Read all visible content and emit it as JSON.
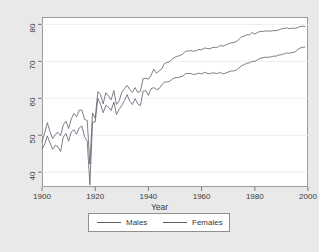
{
  "chart_data": {
    "type": "line",
    "title": "",
    "xlabel": "Year",
    "ylabel": "",
    "xlim": [
      1900,
      2000
    ],
    "ylim": [
      36,
      82
    ],
    "grid": true,
    "legend_position": "below-plot",
    "xticks": [
      1900,
      1920,
      1940,
      1960,
      1980,
      2000
    ],
    "yticks": [
      40,
      50,
      60,
      70,
      80
    ],
    "x": [
      1900,
      1901,
      1902,
      1903,
      1904,
      1905,
      1906,
      1907,
      1908,
      1909,
      1910,
      1911,
      1912,
      1913,
      1914,
      1915,
      1916,
      1917,
      1918,
      1919,
      1920,
      1921,
      1922,
      1923,
      1924,
      1925,
      1926,
      1927,
      1928,
      1929,
      1930,
      1931,
      1932,
      1933,
      1934,
      1935,
      1936,
      1937,
      1938,
      1939,
      1940,
      1941,
      1942,
      1943,
      1944,
      1945,
      1946,
      1947,
      1948,
      1949,
      1950,
      1951,
      1952,
      1953,
      1954,
      1955,
      1956,
      1957,
      1958,
      1959,
      1960,
      1961,
      1962,
      1963,
      1964,
      1965,
      1966,
      1967,
      1968,
      1969,
      1970,
      1971,
      1972,
      1973,
      1974,
      1975,
      1976,
      1977,
      1978,
      1979,
      1980,
      1981,
      1982,
      1983,
      1984,
      1985,
      1986,
      1987,
      1988,
      1989,
      1990,
      1991,
      1992,
      1993,
      1994,
      1995,
      1996,
      1997,
      1998,
      1999
    ],
    "series": [
      {
        "name": "Males",
        "color": "#5d5d6b",
        "values": [
          46.3,
          47.6,
          49.8,
          48.0,
          46.2,
          47.3,
          46.9,
          45.6,
          49.5,
          50.5,
          48.4,
          50.9,
          51.5,
          50.3,
          52.0,
          52.5,
          49.6,
          48.4,
          36.6,
          53.5,
          53.6,
          60.0,
          58.4,
          56.1,
          58.1,
          57.6,
          56.7,
          59.0,
          55.6,
          57.0,
          58.1,
          59.4,
          61.0,
          59.2,
          58.3,
          59.9,
          58.5,
          58.0,
          61.9,
          62.1,
          60.8,
          62.6,
          62.9,
          62.4,
          62.6,
          63.6,
          64.4,
          64.4,
          64.6,
          65.2,
          65.6,
          65.6,
          65.8,
          66.0,
          66.7,
          66.7,
          66.7,
          66.4,
          66.6,
          66.8,
          66.6,
          67.0,
          66.8,
          66.6,
          66.9,
          66.8,
          66.7,
          67.0,
          66.6,
          66.8,
          67.1,
          67.4,
          67.4,
          67.6,
          68.2,
          68.8,
          69.1,
          69.5,
          69.6,
          70.0,
          70.0,
          70.4,
          70.8,
          71.0,
          71.1,
          71.1,
          71.2,
          71.4,
          71.4,
          71.7,
          71.8,
          72.0,
          72.3,
          72.2,
          72.4,
          72.5,
          73.1,
          73.6,
          73.8,
          73.9
        ]
      },
      {
        "name": "Females",
        "color": "#5d5d6b",
        "values": [
          48.3,
          50.6,
          53.4,
          51.0,
          49.1,
          50.2,
          50.8,
          49.9,
          52.8,
          53.8,
          51.8,
          54.4,
          55.9,
          55.0,
          56.8,
          56.8,
          54.3,
          54.0,
          42.2,
          56.0,
          54.6,
          61.8,
          61.0,
          58.5,
          61.5,
          60.6,
          59.6,
          62.1,
          58.3,
          59.3,
          61.6,
          62.6,
          63.5,
          62.4,
          61.6,
          62.9,
          61.6,
          61.9,
          65.3,
          65.4,
          65.2,
          66.2,
          67.9,
          66.8,
          67.4,
          67.9,
          69.4,
          69.7,
          69.9,
          70.7,
          71.1,
          71.4,
          71.6,
          72.0,
          72.8,
          72.8,
          72.9,
          72.7,
          72.9,
          73.2,
          73.1,
          73.6,
          73.5,
          73.4,
          73.7,
          73.8,
          73.8,
          74.3,
          74.1,
          74.4,
          74.7,
          75.0,
          75.1,
          75.3,
          75.9,
          76.6,
          76.8,
          77.2,
          77.2,
          77.8,
          77.4,
          77.8,
          78.1,
          78.1,
          78.2,
          78.2,
          78.2,
          78.3,
          78.3,
          78.5,
          78.8,
          78.9,
          79.1,
          78.8,
          79.0,
          78.9,
          79.1,
          79.4,
          79.5,
          79.4
        ]
      }
    ]
  },
  "axes": {
    "x_title": "Year",
    "x_tick_labels": [
      "1900",
      "1920",
      "1940",
      "1960",
      "1980",
      "2000"
    ],
    "y_tick_labels": [
      "40",
      "50",
      "60",
      "70",
      "80"
    ]
  },
  "legend": {
    "items": [
      {
        "label": "Males"
      },
      {
        "label": "Females"
      }
    ]
  },
  "colors": {
    "figure_background": "#e9e9e9",
    "plot_background": "#ffffff",
    "line": "#5d5d6b",
    "grid": "#eceef2",
    "border": "#9a9a9a",
    "text": "#3a3a3a"
  }
}
